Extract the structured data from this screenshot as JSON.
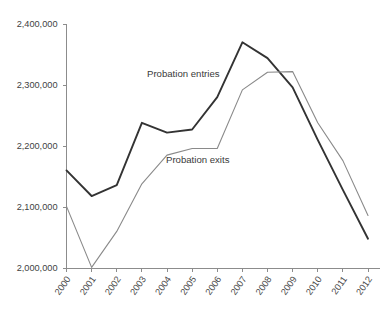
{
  "chart_data": {
    "type": "line",
    "title": "",
    "xlabel": "",
    "ylabel": "",
    "categories": [
      "2000",
      "2001",
      "2002",
      "2003",
      "2004",
      "2005",
      "2006",
      "2007",
      "2008",
      "2009",
      "2010",
      "2011",
      "2012"
    ],
    "ylim": [
      2000000,
      2400000
    ],
    "yticks": [
      2000000,
      2100000,
      2200000,
      2300000,
      2400000
    ],
    "ytick_labels": [
      "2,000,000",
      "2,100,000",
      "2,200,000",
      "2,300,000",
      "2,400,000"
    ],
    "grid": false,
    "legend_position": "inline-annotations",
    "series": [
      {
        "name": "Probation entries",
        "color": "#333333",
        "width": 1.9,
        "values": [
          2160000,
          2118000,
          2136000,
          2238000,
          2222000,
          2227000,
          2280000,
          2370000,
          2344000,
          2296000,
          2210000,
          2128000,
          2048000
        ]
      },
      {
        "name": "Probation exits",
        "color": "#8a8a8a",
        "width": 1.1,
        "values": [
          2101000,
          2001000,
          2060000,
          2138000,
          2185000,
          2196000,
          2196000,
          2292000,
          2321000,
          2322000,
          2238000,
          2176000,
          2086000
        ]
      }
    ],
    "annotations": [
      {
        "text": "Probation entries",
        "x_px": 147,
        "y_px": 77
      },
      {
        "text": "Probation exits",
        "x_px": 166,
        "y_px": 163
      }
    ]
  },
  "axis": {
    "y_axis_name": "y-axis",
    "x_axis_name": "x-axis"
  }
}
